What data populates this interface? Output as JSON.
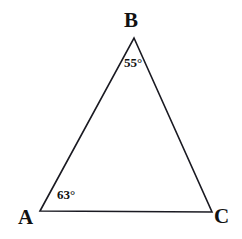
{
  "figure": {
    "type": "triangle-geometry-diagram",
    "background_color": "#ffffff",
    "stroke_color": "#1a1a22",
    "stroke_width": 1.6,
    "width": 242,
    "height": 239
  },
  "vertices": [
    {
      "name": "A",
      "label": "A",
      "x": 40,
      "y": 211
    },
    {
      "name": "B",
      "label": "B",
      "x": 134,
      "y": 38
    },
    {
      "name": "C",
      "label": "C",
      "x": 212,
      "y": 212
    }
  ],
  "angles": [
    {
      "at_vertex": "A",
      "label": "63°",
      "value": 63,
      "unit": "degrees"
    },
    {
      "at_vertex": "B",
      "label": "55°",
      "value": 55,
      "unit": "degrees"
    }
  ],
  "sides": [
    {
      "from": "A",
      "to": "B"
    },
    {
      "from": "B",
      "to": "C"
    },
    {
      "from": "A",
      "to": "C"
    }
  ],
  "chart_data": {
    "type": "diagram",
    "title": "",
    "shape": "triangle",
    "points": {
      "A": [
        40,
        211
      ],
      "B": [
        134,
        38
      ],
      "C": [
        212,
        212
      ]
    },
    "edges": [
      [
        "A",
        "B"
      ],
      [
        "B",
        "C"
      ],
      [
        "A",
        "C"
      ]
    ],
    "annotations": [
      {
        "text": "B",
        "x": 134,
        "y": 22,
        "kind": "vertex-label"
      },
      {
        "text": "55°",
        "x": 137,
        "y": 63,
        "kind": "angle-label"
      },
      {
        "text": "63°",
        "x": 72,
        "y": 196,
        "kind": "angle-label"
      },
      {
        "text": "A",
        "x": 27,
        "y": 219,
        "kind": "vertex-label"
      },
      {
        "text": "C",
        "x": 223,
        "y": 217,
        "kind": "vertex-label"
      }
    ],
    "grid": false,
    "legend": false
  }
}
